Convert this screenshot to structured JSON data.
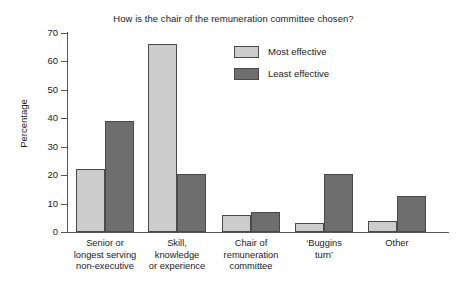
{
  "chart_data": {
    "type": "bar",
    "title": "How is the chair of the remuneration committee chosen?",
    "xlabel": "",
    "ylabel": "Percentage",
    "ylim": [
      0,
      70
    ],
    "yticks": [
      0,
      10,
      20,
      30,
      40,
      50,
      60,
      70
    ],
    "grid": false,
    "legend_position": "upper-right-inside",
    "categories": [
      "Senior or longest serving non-executive",
      "Skill, knowledge or experience",
      "Chair of remuneration committee",
      "'Buggins turn'",
      "Other"
    ],
    "category_lines": [
      [
        "Senior or",
        "longest serving",
        "non-executive"
      ],
      [
        "Skill,",
        "knowledge",
        "or experience"
      ],
      [
        "Chair of",
        "remuneration",
        "committee"
      ],
      [
        "‘Buggins",
        "turn’"
      ],
      [
        "Other"
      ]
    ],
    "series": [
      {
        "name": "Most effective",
        "color": "#cccccc",
        "values": [
          22,
          66,
          6,
          3,
          4
        ]
      },
      {
        "name": "Least effective",
        "color": "#6e6e6e",
        "values": [
          39,
          20.5,
          7,
          20.5,
          12.5
        ]
      }
    ]
  },
  "axis": {
    "y_tick_labels": [
      "70",
      "60",
      "50",
      "40",
      "30",
      "20",
      "10",
      "0"
    ],
    "y_title": "Percentage"
  },
  "legend": {
    "items": [
      {
        "label": "Most effective",
        "color": "#cccccc"
      },
      {
        "label": "Least effective",
        "color": "#6e6e6e"
      }
    ]
  },
  "colors": {
    "most_effective": "#cccccc",
    "least_effective": "#6e6e6e",
    "axis": "#555555",
    "bar_border": "#4a4a4a",
    "text": "#1a1a1a",
    "background": "#ffffff"
  }
}
